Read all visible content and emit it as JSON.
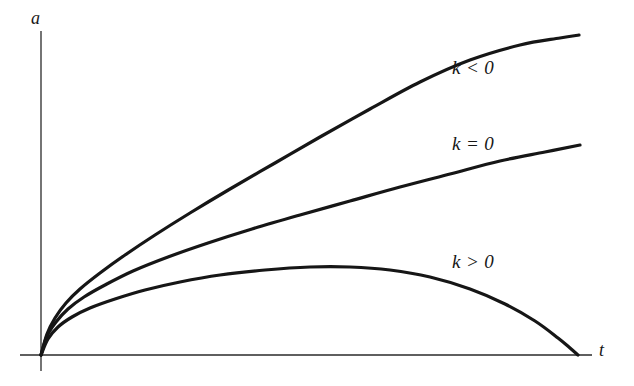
{
  "figure": {
    "background_color": "#ffffff",
    "ink_color": "#161616",
    "axis_color": "#2a2a2a",
    "curve_stroke_width": 3.2,
    "axis_stroke_width": 1.3
  },
  "axes": {
    "y_label": "a",
    "x_label": "t",
    "origin": {
      "x": 41,
      "y": 355
    },
    "y_axis_top": {
      "x": 41,
      "y": 31
    },
    "y_axis_bottom": {
      "x": 41,
      "y": 371
    },
    "x_axis_right": {
      "x": 592,
      "y": 355
    }
  },
  "labels": {
    "k_negative": "k < 0",
    "k_zero": "k = 0",
    "k_positive": "k > 0"
  },
  "chart_data": {
    "type": "line",
    "title": "",
    "xlabel": "t",
    "ylabel": "a",
    "grid": false,
    "legend": "inline-annotations",
    "xlim": [
      0,
      1
    ],
    "ylim": [
      0,
      1
    ],
    "series": [
      {
        "name": "k < 0",
        "label": "k < 0",
        "style": "solid",
        "behavior": "open-universe-expands-forever",
        "label_position": {
          "x": 452,
          "y": 57
        },
        "points_px": [
          [
            41,
            355
          ],
          [
            47,
            334
          ],
          [
            55,
            318
          ],
          [
            66,
            303
          ],
          [
            80,
            289
          ],
          [
            100,
            273
          ],
          [
            125,
            255
          ],
          [
            155,
            235
          ],
          [
            190,
            213
          ],
          [
            230,
            189
          ],
          [
            275,
            163
          ],
          [
            320,
            137
          ],
          [
            370,
            109
          ],
          [
            420,
            82
          ],
          [
            470,
            60
          ],
          [
            520,
            45
          ],
          [
            560,
            38
          ],
          [
            579,
            35
          ]
        ],
        "values": [
          {
            "t": 0.0,
            "a": 0.0
          },
          {
            "t": 0.02,
            "a": 0.07
          },
          {
            "t": 0.06,
            "a": 0.14
          },
          {
            "t": 0.11,
            "a": 0.2
          },
          {
            "t": 0.18,
            "a": 0.26
          },
          {
            "t": 0.27,
            "a": 0.34
          },
          {
            "t": 0.36,
            "a": 0.43
          },
          {
            "t": 0.46,
            "a": 0.52
          },
          {
            "t": 0.57,
            "a": 0.61
          },
          {
            "t": 0.69,
            "a": 0.7
          },
          {
            "t": 0.81,
            "a": 0.79
          },
          {
            "t": 0.92,
            "a": 0.87
          },
          {
            "t": 0.97,
            "a": 0.92
          },
          {
            "t": 1.0,
            "a": 0.99
          }
        ]
      },
      {
        "name": "k = 0",
        "label": "k = 0",
        "style": "solid",
        "behavior": "flat-universe-critical-expansion",
        "label_position": {
          "x": 452,
          "y": 133
        },
        "points_px": [
          [
            41,
            355
          ],
          [
            47,
            336
          ],
          [
            56,
            322
          ],
          [
            68,
            309
          ],
          [
            84,
            297
          ],
          [
            105,
            285
          ],
          [
            133,
            271
          ],
          [
            168,
            257
          ],
          [
            208,
            243
          ],
          [
            252,
            229
          ],
          [
            300,
            215
          ],
          [
            350,
            201
          ],
          [
            400,
            187
          ],
          [
            450,
            174
          ],
          [
            500,
            161
          ],
          [
            545,
            152
          ],
          [
            580,
            145
          ]
        ],
        "values": [
          {
            "t": 0.0,
            "a": 0.0
          },
          {
            "t": 0.02,
            "a": 0.06
          },
          {
            "t": 0.07,
            "a": 0.12
          },
          {
            "t": 0.13,
            "a": 0.17
          },
          {
            "t": 0.21,
            "a": 0.22
          },
          {
            "t": 0.31,
            "a": 0.28
          },
          {
            "t": 0.42,
            "a": 0.34
          },
          {
            "t": 0.55,
            "a": 0.4
          },
          {
            "t": 0.67,
            "a": 0.46
          },
          {
            "t": 0.79,
            "a": 0.52
          },
          {
            "t": 0.9,
            "a": 0.57
          },
          {
            "t": 1.0,
            "a": 0.62
          }
        ]
      },
      {
        "name": "k > 0",
        "label": "k > 0",
        "style": "solid",
        "behavior": "closed-universe-expands-then-recollapses",
        "label_position": {
          "x": 452,
          "y": 251
        },
        "peak_px": {
          "x": 330,
          "y": 267
        },
        "peak_value": {
          "t": 0.54,
          "a": 0.26
        },
        "returns_to_axis_px": {
          "x": 578,
          "y": 355
        },
        "points_px": [
          [
            41,
            355
          ],
          [
            48,
            339
          ],
          [
            58,
            327
          ],
          [
            72,
            317
          ],
          [
            90,
            308
          ],
          [
            115,
            299
          ],
          [
            145,
            290
          ],
          [
            180,
            282
          ],
          [
            220,
            275
          ],
          [
            265,
            270
          ],
          [
            310,
            267
          ],
          [
            350,
            267
          ],
          [
            390,
            270
          ],
          [
            430,
            277
          ],
          [
            470,
            289
          ],
          [
            505,
            304
          ],
          [
            535,
            321
          ],
          [
            558,
            338
          ],
          [
            570,
            348
          ],
          [
            578,
            355
          ]
        ],
        "values": [
          {
            "t": 0.0,
            "a": 0.0
          },
          {
            "t": 0.03,
            "a": 0.06
          },
          {
            "t": 0.09,
            "a": 0.1
          },
          {
            "t": 0.18,
            "a": 0.15
          },
          {
            "t": 0.29,
            "a": 0.2
          },
          {
            "t": 0.41,
            "a": 0.24
          },
          {
            "t": 0.54,
            "a": 0.26
          },
          {
            "t": 0.65,
            "a": 0.25
          },
          {
            "t": 0.78,
            "a": 0.21
          },
          {
            "t": 0.9,
            "a": 0.14
          },
          {
            "t": 0.97,
            "a": 0.05
          },
          {
            "t": 1.0,
            "a": 0.0
          }
        ]
      }
    ]
  }
}
